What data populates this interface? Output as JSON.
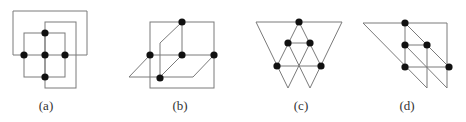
{
  "figure": {
    "panels": [
      {
        "id": "a",
        "label": "(a)",
        "label_x": 46,
        "description": "grid of nested squares with 5 vertices in a plus shape"
      },
      {
        "id": "b",
        "label": "(b)",
        "label_x": 180,
        "description": "square with parallelogram and slanted edges, 5 vertices"
      },
      {
        "id": "c",
        "label": "(c)",
        "label_x": 301,
        "description": "inverted triangle with inner triangular grid, 5 vertices"
      },
      {
        "id": "d",
        "label": "(d)",
        "label_x": 407,
        "description": "right triangle with parallel slants, 5 vertices"
      }
    ],
    "colors": {
      "edge": "#7a7a7a",
      "node": "#111111",
      "background": "#ffffff"
    }
  }
}
